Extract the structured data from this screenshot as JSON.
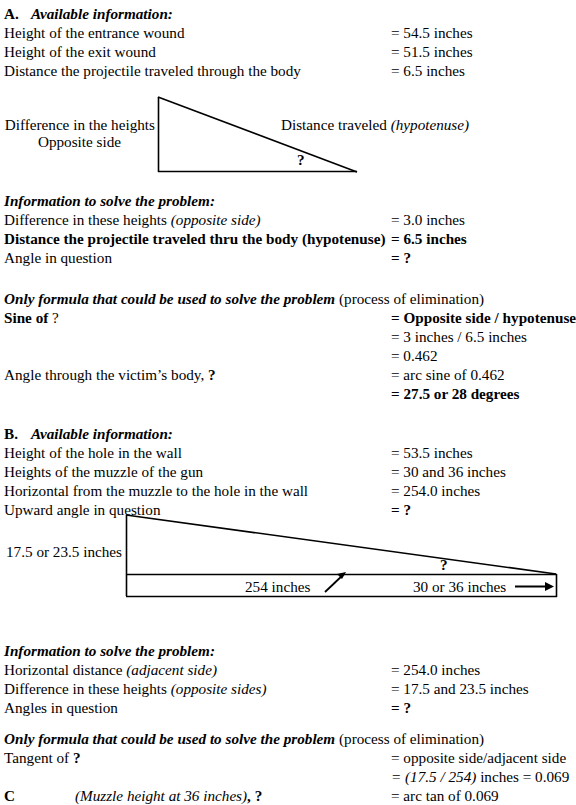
{
  "document": {
    "sections": [
      {
        "letter": "A.",
        "title": "Available information:",
        "rows": [
          {
            "label": "Height of the entrance wound",
            "value": "= 54.5 inches"
          },
          {
            "label": "Height of the exit wound",
            "value": "= 51.5 inches"
          },
          {
            "label": "Distance the projectile traveled through the body",
            "value": "= 6.5 inches"
          }
        ]
      }
    ]
  },
  "diagram_a": {
    "label_left_line1": "Difference in the heights",
    "label_left_line2": "Opposite side",
    "label_hypotenuse": "Distance traveled",
    "label_hypotenuse_italic": "(hypotenuse)",
    "angle_marker": "?"
  },
  "info_a": {
    "heading": "Information to solve the problem:",
    "rows": [
      {
        "label": "Difference in these heights ",
        "label_italic": "(opposite side)",
        "value": "= 3.0 inches"
      },
      {
        "label": "Distance the projectile traveled thru the body (hypotenuse)",
        "value": "= 6.5 inches"
      },
      {
        "label": "Angle in question",
        "value": "= ?"
      }
    ]
  },
  "formula_a": {
    "heading": "Only formula that could be used to solve the problem",
    "heading_suffix": "(process of elimination)",
    "rows": [
      {
        "label": "Sine of ",
        "label_tail": "?",
        "value": "= Opposite side / hypotenuse"
      },
      {
        "label": "",
        "value": "= 3 inches / 6.5 inches"
      },
      {
        "label": "",
        "value": "= 0.462"
      },
      {
        "label": "Angle through the victim’s body, ",
        "label_tail": "?",
        "value": "= arc sine of 0.462"
      },
      {
        "label": "",
        "value": "= 27.5 or 28 degrees"
      }
    ]
  },
  "section_b": {
    "letter": "B.",
    "title": "Available information:",
    "rows": [
      {
        "label": "Height of the hole in the wall",
        "value": "= 53.5 inches"
      },
      {
        "label": "Heights of the muzzle of the gun",
        "value": "= 30 and 36 inches"
      },
      {
        "label": "Horizontal from the muzzle to the hole in the wall",
        "value": "= 254.0 inches"
      },
      {
        "label": "Upward angle in question",
        "value": "= ?"
      }
    ]
  },
  "diagram_b": {
    "label_left": "17.5 or 23.5 inches",
    "label_base_left": "254 inches",
    "label_base_right": "30 or 36 inches",
    "angle_marker": "?"
  },
  "info_b": {
    "heading": "Information to solve the problem:",
    "rows": [
      {
        "label": "Horizontal distance ",
        "label_italic": "(adjacent side)",
        "value": "= 254.0 inches"
      },
      {
        "label": "Difference in these heights ",
        "label_italic": "(opposite sides)",
        "value": "= 17.5 and 23.5 inches"
      },
      {
        "label": "Angles in question",
        "value": "= ?"
      }
    ]
  },
  "formula_b": {
    "heading": "Only formula that could be used to solve the problem",
    "heading_suffix": "(process of elimination)",
    "rows": [
      {
        "label": "Tangent of ",
        "label_tail": "?",
        "value": "= opposite side/adjacent side"
      },
      {
        "label": "",
        "value_italic": "= (17.5 / 254)",
        "value_tail": " inches =  0.069"
      }
    ],
    "section_c": {
      "letter": "C",
      "title": "(Muzzle height at 36 inches)",
      "title_tail": ", ?",
      "value": "= arc tan of 0.069"
    }
  }
}
